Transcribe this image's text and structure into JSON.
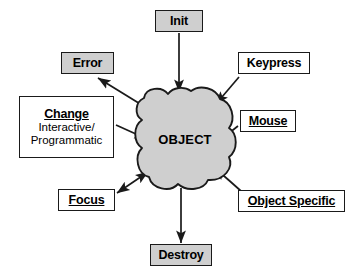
{
  "diagram": {
    "center": {
      "label": "OBJECT",
      "shape": "cloud-blob",
      "fill": "#cfcfcf",
      "stroke": "#1a1a1a"
    },
    "colors": {
      "background": "#ffffff",
      "node_fill_plain": "#ffffff",
      "node_fill_shaded": "#cfcfcf",
      "stroke": "#1a1a1a",
      "text": "#000000"
    },
    "nodes": [
      {
        "id": "init",
        "label": "Init",
        "sublabel": "",
        "filled": true,
        "underlined": false,
        "direction": "into-object",
        "arrow": "single"
      },
      {
        "id": "error",
        "label": "Error",
        "sublabel": "",
        "filled": true,
        "underlined": false,
        "direction": "out-of-object",
        "arrow": "single"
      },
      {
        "id": "keypress",
        "label": "Keypress",
        "sublabel": "",
        "filled": false,
        "underlined": false,
        "direction": "into-object",
        "arrow": "single"
      },
      {
        "id": "change",
        "label": "Change",
        "sublabel_line1": "Interactive/",
        "sublabel_line2": "Programmatic",
        "filled": false,
        "underlined": true,
        "direction": "into-object",
        "arrow": "single"
      },
      {
        "id": "mouse",
        "label": "Mouse",
        "sublabel": "",
        "filled": false,
        "underlined": true,
        "direction": "into-object",
        "arrow": "single"
      },
      {
        "id": "focus",
        "label": "Focus",
        "sublabel": "",
        "filled": false,
        "underlined": true,
        "direction": "bidirectional",
        "arrow": "double"
      },
      {
        "id": "object-specific",
        "label": "Object Specific",
        "sublabel": "",
        "filled": false,
        "underlined": true,
        "direction": "into-object",
        "arrow": "single"
      },
      {
        "id": "destroy",
        "label": "Destroy",
        "sublabel": "",
        "filled": true,
        "underlined": false,
        "direction": "out-of-object",
        "arrow": "single"
      }
    ]
  }
}
